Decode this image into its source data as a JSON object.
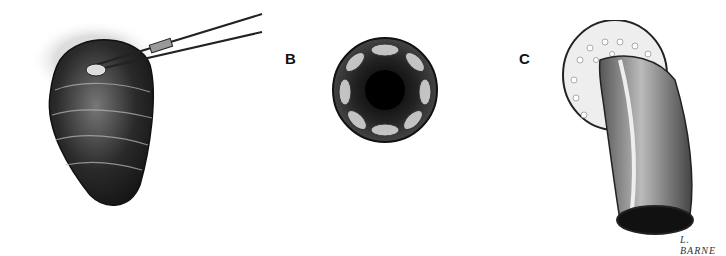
{
  "figure": {
    "panels": [
      {
        "id": "A",
        "label": "",
        "description": "Everted bowel segment held with scissors/clamp"
      },
      {
        "id": "B",
        "label": "B",
        "description": "End-on view of circular intussuscepted bowel with radial folds"
      },
      {
        "id": "C",
        "label": "C",
        "description": "Everted bowel segment with mesentery / fatty tissue cuff"
      }
    ],
    "signature": "L. BARNE"
  }
}
